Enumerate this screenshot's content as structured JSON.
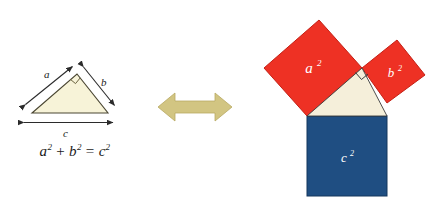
{
  "figure": {
    "background": "#ffffff"
  },
  "left": {
    "name": "right-triangle-with-side-labels",
    "labels": {
      "a": "a",
      "b": "b",
      "c": "c"
    },
    "equation": {
      "lhs_a": "a",
      "exp_a": "2",
      "plus": "+",
      "lhs_b": "b",
      "exp_b": "2",
      "equals": "=",
      "rhs_c": "c",
      "exp_c": "2",
      "full": "a² + b² = c²"
    },
    "triangle": {
      "fill": "#f7f3d8",
      "stroke": "#4a4632",
      "vertices": [
        [
          32,
          113
        ],
        [
          77,
          74
        ],
        [
          108,
          113
        ]
      ],
      "right_angle_vertex": [
        77,
        74
      ]
    },
    "dimension_arrows": {
      "color": "#2b2b2b",
      "sides": [
        "a",
        "b",
        "c"
      ]
    }
  },
  "middle": {
    "name": "equivalence-arrow",
    "glyph": "double-headed-arrow",
    "color": "#d2c582",
    "direction": "horizontal"
  },
  "right": {
    "name": "squares-on-triangle-sides",
    "squares": [
      {
        "label": "a",
        "exponent": "2",
        "color": "#ee3124",
        "text_color": "#ffffff"
      },
      {
        "label": "b",
        "exponent": "2",
        "color": "#ee3124",
        "text_color": "#ffffff"
      },
      {
        "label": "c",
        "exponent": "2",
        "color": "#1f4e82",
        "text_color": "#ffffff"
      }
    ],
    "inner_triangle": {
      "fill": "#f5efda",
      "stroke": "#3b3b3b"
    },
    "right_angle_marker": true
  },
  "colors": {
    "red": "#ee3124",
    "blue": "#1f4e82",
    "cream": "#f5efda",
    "pale_yellow": "#f7f3d8",
    "khaki": "#d2c582",
    "ink": "#1a1a1a"
  }
}
